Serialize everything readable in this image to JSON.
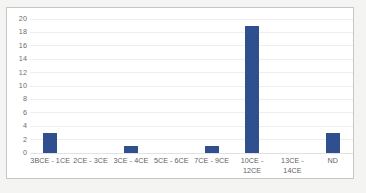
{
  "chart_data": {
    "type": "bar",
    "title": "",
    "subtitle": "",
    "xlabel": "",
    "ylabel": "",
    "categories": [
      "3BCE - 1CE",
      "2CE - 3CE",
      "3CE - 4CE",
      "5CE - 6CE",
      "7CE - 9CE",
      "10CE -\n12CE",
      "13CE -\n14CE",
      "ND"
    ],
    "values": [
      3,
      0,
      1,
      0,
      1,
      19,
      0,
      3
    ],
    "ylim": [
      0,
      20
    ],
    "ytick_step": 2,
    "yticks": [
      "20",
      "18",
      "16",
      "14",
      "12",
      "10",
      "8",
      "6",
      "4",
      "2",
      "0"
    ],
    "ytick_values": [
      20,
      18,
      16,
      14,
      12,
      10,
      8,
      6,
      4,
      2,
      0
    ],
    "grid": true,
    "legend": false,
    "legend_position": "none",
    "series": [
      {
        "name": "",
        "values": [
          3,
          0,
          1,
          0,
          1,
          19,
          0,
          3
        ],
        "color": "#2f4f8f"
      }
    ]
  },
  "style": {
    "bar_color": "#2f4f8f",
    "gridline_color": "#eeeeee",
    "axis_color": "#e2e2e2",
    "frame_border_color": "#c6c6c6",
    "plot_background": "#ffffff",
    "page_background": "#f4f4f3",
    "tick_label_color": "#6d6d6d"
  }
}
